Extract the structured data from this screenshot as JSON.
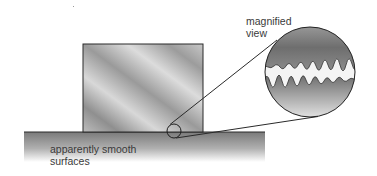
{
  "labels": {
    "magnified": [
      "magnified",
      "view"
    ],
    "surfaces": [
      "apparently smooth",
      "surfaces"
    ]
  },
  "colors": {
    "outline": "#2a2a2a",
    "block_dark": "#8c8c8c",
    "block_light": "#d6d6d6",
    "ground_top": "#7d7d7d",
    "ground_bottom": "#ffffff",
    "gap": "#f2f2f2"
  }
}
